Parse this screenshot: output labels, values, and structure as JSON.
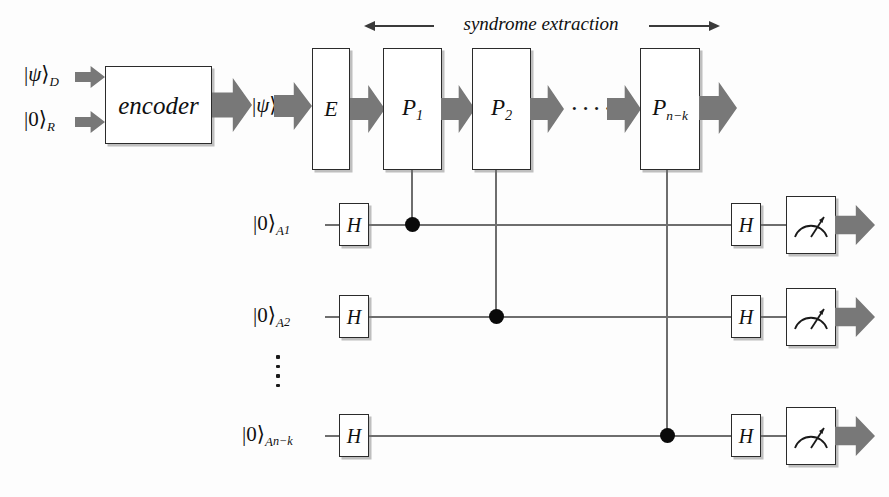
{
  "diagram": {
    "annotation": {
      "syndrome_label": "syndrome extraction"
    },
    "colors": {
      "arrow_gray": "#787878",
      "wire_gray": "#6e6e6e",
      "box_border": "#2b2b2b",
      "dot_black": "#0a0a0a",
      "background": "#fdfdfd"
    },
    "inputs": [
      {
        "id": "in-psi-d",
        "bra": "|",
        "symbol": "ψ",
        "ket": "⟩",
        "sub": "D"
      },
      {
        "id": "in-zero-r",
        "bra": "|",
        "symbol": "0",
        "ket": "⟩",
        "sub": "R"
      }
    ],
    "encoder": {
      "label": "encoder"
    },
    "logical_state": {
      "bra": "|",
      "symbol": "ψ",
      "ket": "⟩",
      "sub": "L"
    },
    "error_gate": {
      "label": "E"
    },
    "projectors": [
      {
        "id": "p1",
        "base": "P",
        "sub": "1"
      },
      {
        "id": "p2",
        "base": "P",
        "sub": "2"
      },
      {
        "id": "pnk",
        "base": "P",
        "sub": "n−k"
      }
    ],
    "projector_ellipsis": "····",
    "ancillas": [
      {
        "id": "a1",
        "bra": "|",
        "symbol": "0",
        "ket": "⟩",
        "sub": "A",
        "subsub": "1",
        "hadamard_in": "H",
        "hadamard_out": "H",
        "measure_icon": "meter-icon"
      },
      {
        "id": "a2",
        "bra": "|",
        "symbol": "0",
        "ket": "⟩",
        "sub": "A",
        "subsub": "2",
        "hadamard_in": "H",
        "hadamard_out": "H",
        "measure_icon": "meter-icon"
      },
      {
        "id": "ank",
        "bra": "|",
        "symbol": "0",
        "ket": "⟩",
        "sub": "A",
        "subsub": "n−k",
        "hadamard_in": "H",
        "hadamard_out": "H",
        "measure_icon": "meter-icon"
      }
    ],
    "ancilla_ellipsis": "vertical-dots"
  }
}
